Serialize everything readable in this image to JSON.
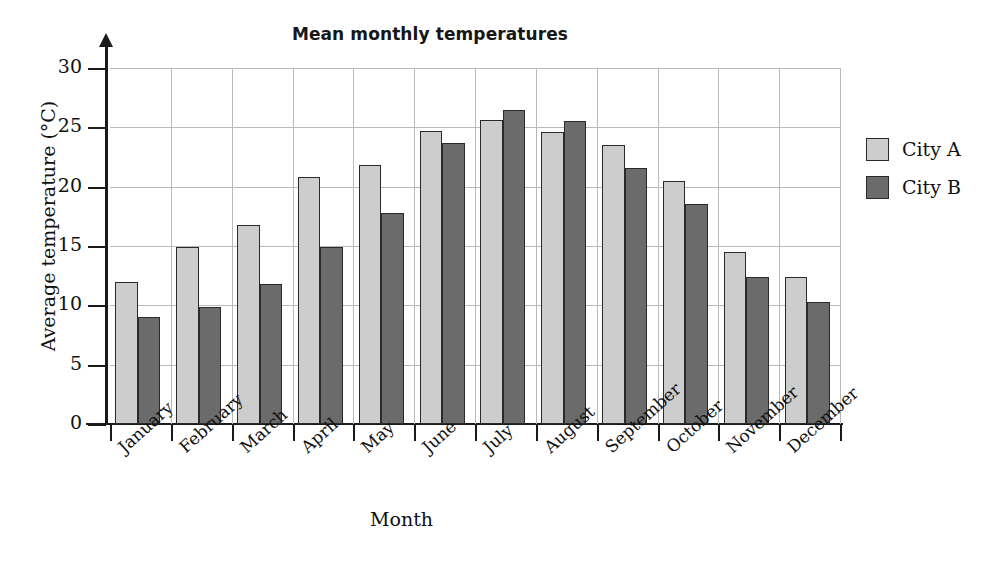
{
  "chart_data": {
    "type": "bar",
    "title": "Mean monthly temperatures",
    "xlabel": "Month",
    "ylabel": "Average temperature (°C)",
    "categories": [
      "January",
      "February",
      "March",
      "April",
      "May",
      "June",
      "July",
      "August",
      "September",
      "October",
      "November",
      "December"
    ],
    "series": [
      {
        "name": "City A",
        "color": "#cdcdcd",
        "values": [
          12.0,
          14.9,
          16.8,
          20.8,
          21.8,
          24.7,
          25.6,
          24.6,
          23.5,
          20.5,
          14.5,
          12.4
        ]
      },
      {
        "name": "City B",
        "color": "#6b6b6b",
        "values": [
          9.0,
          9.9,
          11.8,
          14.9,
          17.8,
          23.7,
          26.5,
          25.5,
          21.6,
          18.5,
          12.4,
          10.3
        ]
      }
    ],
    "ylim": [
      0,
      30
    ],
    "yticks": [
      0,
      5,
      10,
      15,
      20,
      25,
      30
    ],
    "ytick_labels": [
      "0",
      "5",
      "10",
      "15",
      "20",
      "25",
      "30"
    ],
    "grid": "horizontal-and-vertical",
    "legend_position": "right",
    "units": "°C"
  },
  "legend": {
    "entries": [
      {
        "label": "City A",
        "swatch": "light-gray-swatch"
      },
      {
        "label": "City B",
        "swatch": "dark-gray-swatch"
      }
    ]
  }
}
